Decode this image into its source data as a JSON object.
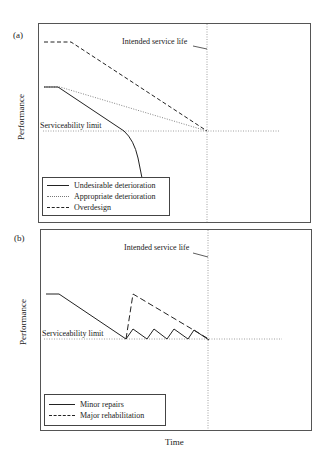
{
  "figure": {
    "x_axis_label": "Time",
    "panels": [
      {
        "tag": "(a)",
        "y_axis_label": "Performance",
        "annotations": {
          "intended_service_life": "Intended service life",
          "serviceability_limit": "Serviceability limit"
        },
        "legend": [
          {
            "label": "Undesirable deterioration",
            "style": "solid"
          },
          {
            "label": "Appropriate deterioration",
            "style": "dotted"
          },
          {
            "label": "Overdesign",
            "style": "dashed"
          }
        ]
      },
      {
        "tag": "(b)",
        "y_axis_label": "Performance",
        "annotations": {
          "intended_service_life": "Intended service life",
          "serviceability_limit": "Serviceability limit"
        },
        "legend": [
          {
            "label": "Minor repairs",
            "style": "solid"
          },
          {
            "label": "Major rehabilitation",
            "style": "dashed"
          }
        ]
      }
    ]
  },
  "colors": {
    "line": "#222222",
    "dotted": "#777777",
    "frame": "#555555",
    "background": "#ffffff"
  }
}
